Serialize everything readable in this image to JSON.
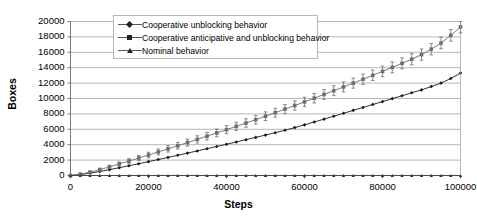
{
  "chart_data": {
    "type": "line",
    "title": "",
    "xlabel": "Steps",
    "ylabel": "Boxes",
    "xlim": [
      0,
      100000
    ],
    "ylim": [
      0,
      20000
    ],
    "grid": true,
    "grid_axis": "y",
    "legend_position": "top-center",
    "xticks": [
      0,
      20000,
      40000,
      60000,
      80000,
      100000
    ],
    "xtick_labels": [
      "0",
      "20000",
      "40000",
      "60000",
      "80000",
      "100000"
    ],
    "yticks": [
      0,
      2000,
      4000,
      6000,
      8000,
      10000,
      12000,
      14000,
      16000,
      18000,
      20000
    ],
    "ytick_labels": [
      "0",
      "2000",
      "4000",
      "6000",
      "8000",
      "10000",
      "12000",
      "14000",
      "16000",
      "18000",
      "20000"
    ],
    "x": [
      0,
      2500,
      5000,
      7500,
      10000,
      12500,
      15000,
      17500,
      20000,
      22500,
      25000,
      27500,
      30000,
      32500,
      35000,
      37500,
      40000,
      42500,
      45000,
      47500,
      50000,
      52500,
      55000,
      57500,
      60000,
      62500,
      65000,
      67500,
      70000,
      72500,
      75000,
      77500,
      80000,
      82500,
      85000,
      87500,
      90000,
      92500,
      95000,
      97500,
      100000
    ],
    "series": [
      {
        "name": "Cooperative unblocking behavior",
        "marker": "diamond",
        "color": "#1a1a1a",
        "error_bars": false,
        "values": [
          0,
          120,
          300,
          520,
          760,
          1010,
          1270,
          1530,
          1800,
          2070,
          2350,
          2630,
          2910,
          3190,
          3480,
          3770,
          4060,
          4350,
          4650,
          4950,
          5250,
          5560,
          5880,
          6220,
          6580,
          6950,
          7320,
          7700,
          8080,
          8460,
          8840,
          9220,
          9600,
          9980,
          10360,
          10740,
          11120,
          11550,
          12000,
          12600,
          13300
        ]
      },
      {
        "name": "Cooperative anticipative and unblocking behavior",
        "marker": "square",
        "color": "#6e6e6e",
        "error_bars": true,
        "values": [
          0,
          180,
          430,
          760,
          1120,
          1500,
          1880,
          2270,
          2660,
          3060,
          3460,
          3870,
          4280,
          4690,
          5110,
          5530,
          5950,
          6380,
          6810,
          7250,
          7700,
          8160,
          8620,
          9090,
          9560,
          10040,
          10520,
          11010,
          11500,
          12000,
          12500,
          13010,
          13520,
          14040,
          14560,
          15100,
          15700,
          16400,
          17200,
          18200,
          19300
        ],
        "error": [
          0,
          80,
          130,
          180,
          220,
          260,
          300,
          330,
          360,
          390,
          410,
          430,
          450,
          470,
          490,
          500,
          520,
          530,
          550,
          560,
          570,
          580,
          590,
          600,
          610,
          620,
          630,
          640,
          650,
          660,
          670,
          680,
          690,
          700,
          710,
          720,
          730,
          740,
          750,
          760,
          770
        ]
      },
      {
        "name": "Nominal behavior",
        "marker": "triangle",
        "color": "#333333",
        "error_bars": false,
        "values": [
          0,
          0,
          0,
          0,
          0,
          0,
          0,
          0,
          0,
          0,
          0,
          0,
          0,
          0,
          0,
          0,
          0,
          0,
          0,
          0,
          0,
          0,
          0,
          0,
          0,
          0,
          0,
          0,
          0,
          0,
          0,
          0,
          0,
          0,
          0,
          0,
          0,
          0,
          0,
          0,
          0
        ]
      }
    ]
  },
  "legend": {
    "entries": [
      {
        "label": "Cooperative unblocking behavior",
        "marker": "diamond"
      },
      {
        "label": "Cooperative anticipative and unblocking behavior",
        "marker": "square"
      },
      {
        "label": "Nominal behavior",
        "marker": "triangle"
      }
    ]
  },
  "axes": {
    "x_title": "Steps",
    "y_title": "Boxes"
  }
}
